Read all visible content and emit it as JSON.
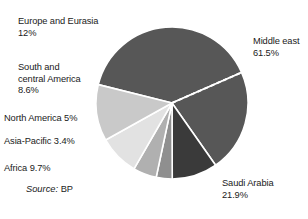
{
  "chart_data": {
    "type": "pie",
    "title": "",
    "source": {
      "label": "Source:",
      "value": "BP"
    },
    "center": {
      "x": 78,
      "y": 78
    },
    "radius": 76,
    "start_angle_deg": -76,
    "separator_color": "#ffffff",
    "categories": [
      "Middle east",
      "Saudi Arabia",
      "Africa",
      "Asia-Pacific",
      "North America",
      "South and central America",
      "Europe and Eurasia"
    ],
    "values": [
      61.5,
      21.9,
      9.7,
      3.4,
      5.0,
      8.6,
      12.0
    ],
    "slices": [
      {
        "name": "Middle east",
        "value": 61.5,
        "value_text": "61.5%",
        "label_text": "Middle east\n61.5%",
        "color": "#575757",
        "note": "outer ring of Middle east; Saudi Arabia is a dashed sub-wedge inside it"
      },
      {
        "name": "Saudi Arabia",
        "value": 21.9,
        "value_text": "21.9%",
        "label_text": "Saudi Arabia\n21.9%",
        "color": "#575757",
        "divider": "dashed-white"
      },
      {
        "name": "Africa",
        "value": 9.7,
        "value_text": "9.7%",
        "label_text": "Africa 9.7%",
        "color": "#3a3a3a"
      },
      {
        "name": "Asia-Pacific",
        "value": 3.4,
        "value_text": "3.4%",
        "label_text": "Asia-Pacific 3.4%",
        "color": "#8f8f8f"
      },
      {
        "name": "North America",
        "value": 5.0,
        "value_text": "5%",
        "label_text": "North America 5%",
        "color": "#b0b0b0"
      },
      {
        "name": "South and central America",
        "value": 8.6,
        "value_text": "8.6%",
        "label_text": "South and\ncentral America\n8.6%",
        "color": "#e2e2e2"
      },
      {
        "name": "Europe and Eurasia",
        "value": 12.0,
        "value_text": "12%",
        "label_text": "Europe and Eurasia\n12%",
        "color": "#c9c9c9"
      }
    ],
    "legend": "none",
    "grid": false,
    "xlabel": "",
    "ylabel": ""
  },
  "labels": {
    "europe": "Europe and Eurasia\n12%",
    "south_central_america": "South and\ncentral America\n8.6%",
    "north_america": "North America 5%",
    "asia_pacific": "Asia-Pacific 3.4%",
    "africa": "Africa 9.7%",
    "middle_east": "Middle east\n61.5%",
    "saudi_arabia": "Saudi Arabia\n21.9%"
  },
  "source": {
    "word": "Source:",
    "value": "BP"
  }
}
